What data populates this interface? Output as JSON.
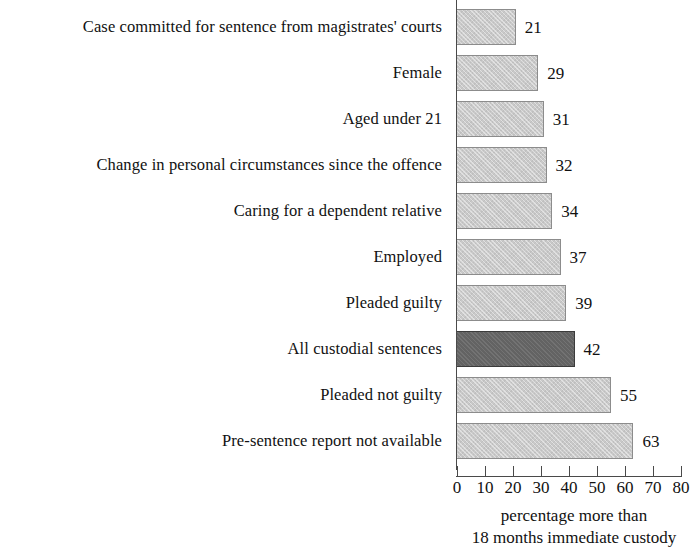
{
  "chart_data": {
    "type": "bar",
    "orientation": "horizontal",
    "title": "",
    "subtitle": "",
    "xlabel": "percentage more than 18 months immediate custody",
    "ylabel": "",
    "xlim": [
      0,
      80
    ],
    "xticks": [
      0,
      10,
      20,
      30,
      40,
      50,
      60,
      70,
      80
    ],
    "grid": false,
    "legend": null,
    "categories": [
      "Case committed for sentence from magistrates' courts",
      "Female",
      "Aged under 21",
      "Change in personal circumstances since the offence",
      "Caring for a dependent relative",
      "Employed",
      "Pleaded guilty",
      "All custodial sentences",
      "Pleaded not guilty",
      "Pre-sentence report not available"
    ],
    "values": [
      21,
      29,
      31,
      32,
      34,
      37,
      39,
      42,
      55,
      63
    ],
    "value_labels": [
      "21",
      "29",
      "31",
      "32",
      "34",
      "37",
      "39",
      "42",
      "55",
      "63"
    ],
    "highlighted_index": 7,
    "colors": {
      "bar": "#c9c9c9",
      "bar_border": "#8c8c8c",
      "bar_highlight": "#636363",
      "axis": "#4a4a4a",
      "text": "#111111",
      "background": "#ffffff"
    }
  },
  "caption": {
    "line1": "percentage more than",
    "line2": "18 months immediate custody"
  }
}
